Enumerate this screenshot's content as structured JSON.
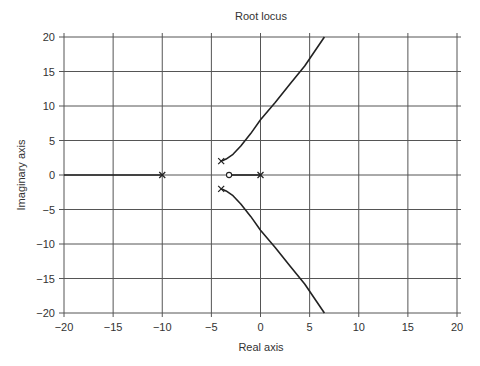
{
  "chart_data": {
    "type": "line",
    "title": "Root locus",
    "xlabel": "Real axis",
    "ylabel": "Imaginary axis",
    "xlim": [
      -20,
      20
    ],
    "ylim": [
      -20,
      20
    ],
    "xticks": [
      -20,
      -15,
      -10,
      -5,
      0,
      5,
      10,
      15,
      20
    ],
    "yticks": [
      -20,
      -15,
      -10,
      -5,
      0,
      5,
      10,
      15,
      20
    ],
    "xtick_labels": [
      "−20",
      "−15",
      "−10",
      "−5",
      "0",
      "5",
      "10",
      "15",
      "20"
    ],
    "ytick_labels": [
      "−20",
      "−15",
      "−10",
      "−5",
      "0",
      "5",
      "10",
      "15",
      "20"
    ],
    "grid": true,
    "legend": null,
    "poles": [
      [
        0,
        0
      ],
      [
        -10,
        0
      ],
      [
        -4,
        2
      ],
      [
        -4,
        -2
      ]
    ],
    "zeros": [
      [
        -3.2,
        0
      ]
    ],
    "series": [
      {
        "name": "real-axis-segment-left",
        "x": [
          -20,
          -10
        ],
        "y": [
          0,
          0
        ]
      },
      {
        "name": "real-axis-segment-right",
        "x": [
          -3.2,
          0
        ],
        "y": [
          0,
          0
        ]
      },
      {
        "name": "upper-branch",
        "x": [
          -4,
          -3.5,
          -2.8,
          -2,
          -1,
          0,
          1.5,
          3,
          4.5,
          6.5
        ],
        "y": [
          2,
          2.3,
          3,
          4.2,
          6,
          8,
          10.5,
          13.2,
          15.8,
          20
        ]
      },
      {
        "name": "lower-branch",
        "x": [
          -4,
          -3.5,
          -2.8,
          -2,
          -1,
          0,
          1.5,
          3,
          4.5,
          6.5
        ],
        "y": [
          -2,
          -2.3,
          -3,
          -4.2,
          -6,
          -8,
          -10.5,
          -13.2,
          -15.8,
          -20
        ]
      }
    ]
  }
}
